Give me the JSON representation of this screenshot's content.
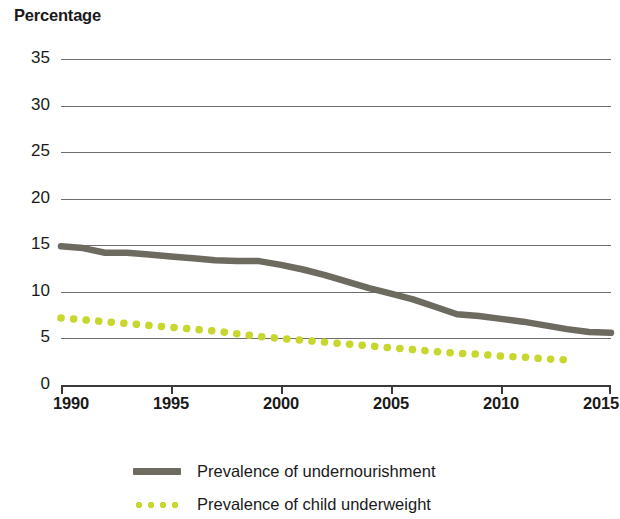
{
  "chart_data": {
    "type": "line",
    "title": "Percentage",
    "xlabel": "",
    "ylabel": "Percentage",
    "xlim": [
      1990,
      2015
    ],
    "ylim": [
      0,
      35
    ],
    "y_ticks": [
      0,
      5,
      10,
      15,
      20,
      25,
      30,
      35
    ],
    "x_ticks": [
      1990,
      1995,
      2000,
      2005,
      2010,
      2015
    ],
    "grid": "horizontal",
    "legend_position": "bottom",
    "series": [
      {
        "name": "Prevalence of undernourishment",
        "color": "#6d6a60",
        "style": "solid",
        "x": [
          1990,
          1991,
          1992,
          1993,
          1994,
          1995,
          1996,
          1997,
          1998,
          1999,
          2000,
          2001,
          2002,
          2003,
          2004,
          2005,
          2006,
          2007,
          2008,
          2009,
          2010,
          2011,
          2012,
          2013,
          2014,
          2015
        ],
        "values": [
          14.9,
          14.7,
          14.2,
          14.2,
          14.0,
          13.8,
          13.6,
          13.4,
          13.3,
          13.3,
          12.9,
          12.4,
          11.8,
          11.1,
          10.4,
          9.8,
          9.2,
          8.4,
          7.6,
          7.4,
          7.1,
          6.8,
          6.4,
          6.0,
          5.7,
          5.6
        ]
      },
      {
        "name": "Prevalence of child underweight",
        "color": "#c8d72e",
        "style": "dotted",
        "x": [
          1990,
          1991,
          1992,
          1993,
          1994,
          1995,
          1996,
          1997,
          1998,
          1999,
          2000,
          2001,
          2002,
          2003,
          2004,
          2005,
          2006,
          2007,
          2008,
          2009,
          2010,
          2011,
          2012,
          2013
        ],
        "values": [
          7.2,
          7.0,
          6.8,
          6.6,
          6.4,
          6.2,
          6.0,
          5.8,
          5.5,
          5.2,
          5.0,
          4.8,
          4.6,
          4.4,
          4.2,
          4.0,
          3.8,
          3.6,
          3.4,
          3.3,
          3.1,
          3.0,
          2.8,
          2.7
        ]
      }
    ]
  },
  "axis": {
    "y_title": "Percentage",
    "y_tick_labels": [
      "35",
      "30",
      "25",
      "20",
      "15",
      "10",
      "5",
      "0"
    ],
    "x_tick_labels": [
      "1990",
      "1995",
      "2000",
      "2005",
      "2010",
      "2015"
    ]
  },
  "legend": {
    "items": [
      {
        "label": "Prevalence of undernourishment",
        "style": "solid"
      },
      {
        "label": "Prevalence of child underweight",
        "style": "dotted"
      }
    ]
  },
  "colors": {
    "undernourishment": "#6d6a60",
    "child_underweight": "#c8d72e",
    "gridline": "#6e6e6e",
    "text": "#1a1a1a",
    "background": "#ffffff"
  }
}
